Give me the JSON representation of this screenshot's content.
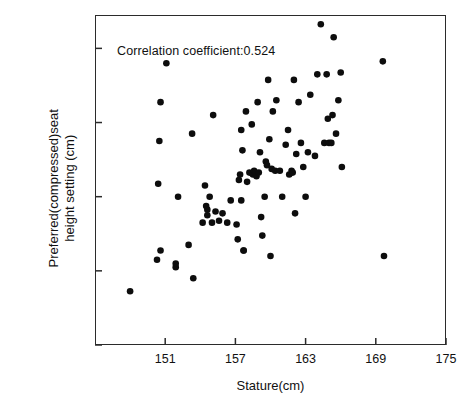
{
  "chart_data": {
    "type": "scatter",
    "title": "",
    "xlabel": "Stature(cm)",
    "ylabel_line1": "Preferred(compressed)seat",
    "ylabel_line2": "height setting (cm)",
    "annotation": "Correlation coefficient:0.524",
    "correlation_coefficient": 0.524,
    "xlim": [
      145,
      175
    ],
    "ylim": [
      35,
      52.8
    ],
    "xticks": [
      151,
      157,
      163,
      169,
      175
    ],
    "yticks": [
      35,
      39,
      43,
      47,
      51
    ],
    "xticklabels": [
      "151",
      "157",
      "163",
      "169",
      "175"
    ],
    "yticklabels": [
      "35",
      "39",
      "43",
      "47",
      "51"
    ],
    "grid": false,
    "legend": false,
    "marker": "filled-circle",
    "marker_color": "#0d0d0d",
    "marker_size_px": 6.6,
    "points": [
      [
        148.0,
        37.9
      ],
      [
        150.3,
        39.6
      ],
      [
        150.6,
        40.1
      ],
      [
        150.4,
        43.7
      ],
      [
        150.5,
        46.0
      ],
      [
        150.6,
        48.1
      ],
      [
        151.1,
        50.2
      ],
      [
        151.9,
        39.2
      ],
      [
        151.9,
        39.4
      ],
      [
        152.1,
        43.0
      ],
      [
        153.0,
        40.4
      ],
      [
        153.3,
        46.4
      ],
      [
        153.4,
        38.6
      ],
      [
        154.2,
        41.6
      ],
      [
        154.4,
        43.6
      ],
      [
        154.5,
        42.5
      ],
      [
        154.6,
        42.3
      ],
      [
        154.6,
        42.0
      ],
      [
        154.8,
        43.0
      ],
      [
        155.0,
        41.6
      ],
      [
        155.1,
        47.4
      ],
      [
        155.3,
        42.2
      ],
      [
        155.6,
        41.7
      ],
      [
        155.9,
        42.1
      ],
      [
        156.3,
        41.6
      ],
      [
        156.6,
        42.8
      ],
      [
        157.1,
        41.5
      ],
      [
        157.2,
        40.7
      ],
      [
        157.3,
        43.9
      ],
      [
        157.4,
        44.2
      ],
      [
        157.5,
        42.8
      ],
      [
        157.5,
        46.6
      ],
      [
        157.6,
        45.5
      ],
      [
        157.7,
        40.1
      ],
      [
        157.7,
        40.1
      ],
      [
        157.9,
        47.6
      ],
      [
        158.0,
        43.8
      ],
      [
        158.2,
        44.3
      ],
      [
        158.4,
        46.9
      ],
      [
        158.5,
        44.2
      ],
      [
        158.6,
        44.4
      ],
      [
        158.7,
        44.3
      ],
      [
        158.8,
        44.1
      ],
      [
        158.9,
        48.1
      ],
      [
        159.0,
        44.3
      ],
      [
        159.1,
        45.4
      ],
      [
        159.2,
        41.9
      ],
      [
        159.3,
        40.9
      ],
      [
        159.5,
        43.0
      ],
      [
        159.6,
        44.9
      ],
      [
        159.7,
        44.7
      ],
      [
        159.8,
        49.3
      ],
      [
        159.9,
        46.1
      ],
      [
        160.0,
        39.8
      ],
      [
        160.1,
        44.5
      ],
      [
        160.2,
        47.6
      ],
      [
        160.4,
        44.4
      ],
      [
        160.5,
        48.2
      ],
      [
        160.8,
        44.4
      ],
      [
        161.0,
        43.0
      ],
      [
        161.3,
        45.8
      ],
      [
        161.5,
        46.6
      ],
      [
        161.6,
        44.2
      ],
      [
        161.8,
        44.4
      ],
      [
        161.9,
        44.3
      ],
      [
        162.0,
        49.3
      ],
      [
        162.1,
        42.1
      ],
      [
        162.2,
        45.3
      ],
      [
        162.4,
        48.1
      ],
      [
        162.6,
        45.9
      ],
      [
        162.8,
        44.6
      ],
      [
        163.0,
        43.0
      ],
      [
        163.2,
        45.4
      ],
      [
        163.4,
        48.5
      ],
      [
        163.8,
        45.2
      ],
      [
        164.0,
        49.6
      ],
      [
        164.3,
        52.3
      ],
      [
        164.6,
        45.9
      ],
      [
        164.8,
        49.6
      ],
      [
        164.9,
        47.2
      ],
      [
        165.0,
        45.9
      ],
      [
        165.2,
        45.9
      ],
      [
        165.3,
        47.4
      ],
      [
        165.4,
        51.6
      ],
      [
        165.6,
        46.4
      ],
      [
        165.8,
        48.2
      ],
      [
        166.0,
        49.7
      ],
      [
        166.1,
        44.6
      ],
      [
        169.6,
        50.3
      ],
      [
        169.7,
        39.8
      ]
    ]
  }
}
